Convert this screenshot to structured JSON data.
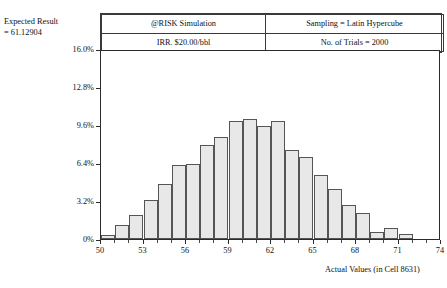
{
  "top_partial_text": "",
  "expected": {
    "line1": "Expected Result",
    "line2": "= 61.12904"
  },
  "info_table": {
    "rows": [
      {
        "left": "@RISK Simulation",
        "right": "Sampling = Latin Hypercube"
      },
      {
        "left": "IRR. $20.00/bbl",
        "right": "No. of Trials = 2000"
      }
    ]
  },
  "chart_data": {
    "type": "bar",
    "title": "@RISK Simulation",
    "subtitle": "IRR. $20.00/bbl",
    "xlabel": "Actual Values (in Cell 8631)",
    "ylabel": "",
    "xlim": [
      50,
      74
    ],
    "ylim": [
      0,
      16.0
    ],
    "grid": false,
    "legend": null,
    "ytick_labels": [
      "0%",
      "3.2%",
      "6.4%",
      "9.6%",
      "12.8%",
      "16.0%"
    ],
    "ytick_values": [
      0,
      3.2,
      6.4,
      9.6,
      12.8,
      16.0
    ],
    "xtick_labels": [
      "50",
      "53",
      "56",
      "59",
      "62",
      "65",
      "68",
      "71",
      "74"
    ],
    "xtick_values": [
      50,
      53,
      56,
      59,
      62,
      65,
      68,
      71,
      74
    ],
    "xminor_step": 1,
    "bin_width": 1,
    "bin_starts": [
      50,
      51,
      52,
      53,
      54,
      55,
      56,
      57,
      58,
      59,
      60,
      61,
      62,
      63,
      64,
      65,
      66,
      67,
      68,
      69,
      70,
      71,
      72,
      73
    ],
    "values": [
      0.3,
      1.2,
      2.0,
      3.3,
      4.6,
      6.2,
      6.3,
      7.9,
      8.6,
      9.9,
      10.1,
      9.5,
      9.9,
      7.5,
      6.9,
      5.4,
      4.2,
      2.9,
      2.2,
      0.6,
      0.9,
      0.4,
      0.0,
      0.0
    ],
    "bar_fill": "#e8e8e8",
    "bar_edge": "#555555",
    "axis_color": "#2b2b2b",
    "background": "#ffffff"
  }
}
